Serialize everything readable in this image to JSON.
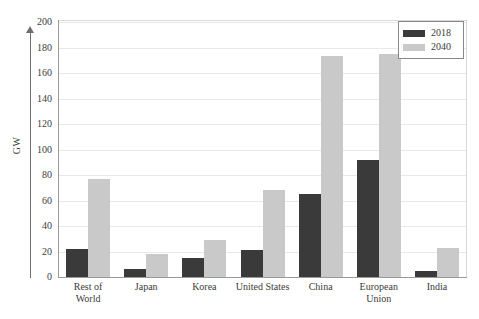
{
  "chart_data": {
    "type": "bar",
    "title": "",
    "xlabel": "",
    "ylabel": "GW",
    "ylim": [
      0,
      200
    ],
    "ytick_step": 20,
    "yticks": [
      0,
      20,
      40,
      60,
      80,
      100,
      120,
      140,
      160,
      180,
      200
    ],
    "ytick_labels": [
      "0",
      "20",
      "40",
      "60",
      "80",
      "100",
      "120",
      "140",
      "160",
      "180",
      "200"
    ],
    "grid": true,
    "grid_axis": "y",
    "legend_position": "top-right",
    "categories": [
      "Rest of\nWorld",
      "Japan",
      "Korea",
      "United States",
      "China",
      "European\nUnion",
      "India"
    ],
    "series": [
      {
        "name": "2018",
        "color": "#3a3a3a",
        "values": [
          22,
          6,
          15,
          21,
          65,
          92,
          5
        ]
      },
      {
        "name": "2040",
        "color": "#c9c9c9",
        "values": [
          77,
          18,
          29,
          68,
          173,
          175,
          23
        ]
      }
    ]
  },
  "legend": {
    "items": [
      {
        "label": "2018",
        "color": "#3a3a3a"
      },
      {
        "label": "2040",
        "color": "#c9c9c9"
      }
    ]
  },
  "axis": {
    "y_title": "GW"
  }
}
